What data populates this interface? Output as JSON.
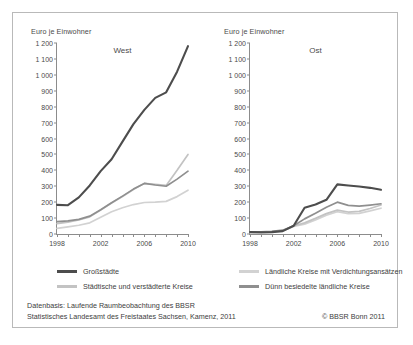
{
  "figure": {
    "axis_title": "Euro je Einwohner",
    "panels": [
      {
        "label": "West",
        "key": "west"
      },
      {
        "label": "Ost",
        "key": "ost"
      }
    ]
  },
  "legend": [
    {
      "label": "Großstädte",
      "color": "#4d4d4d"
    },
    {
      "label": "Ländliche Kreise mit Verdichtungsansätzen",
      "color": "#d2d2d2"
    },
    {
      "label": "Städtische und verstädterte Kreise",
      "color": "#c3c3c3"
    },
    {
      "label": "Dünn besiedelte ländliche Kreise",
      "color": "#8f8f8f"
    }
  ],
  "source": {
    "line1": "Datenbasis: Laufende Raumbeobachtung des BBSR",
    "line2": "Statistisches Landesamt des Freistaates Sachsen, Kamenz, 2011",
    "copyright": "© BBSR Bonn 2011"
  },
  "chart_data": {
    "type": "line",
    "title": "Euro je Einwohner",
    "xlabel": "",
    "ylabel": "Euro je Einwohner",
    "ylim": [
      0,
      1200
    ],
    "ytick_values": [
      0,
      100,
      200,
      300,
      400,
      500,
      600,
      700,
      800,
      900,
      1000,
      1100,
      1200
    ],
    "ytick_labels": [
      "0",
      "100",
      "200",
      "300",
      "400",
      "500",
      "600",
      "700",
      "800",
      "900",
      "1 000",
      "1 100",
      "1 200"
    ],
    "x": [
      1998,
      1999,
      2000,
      2001,
      2002,
      2003,
      2004,
      2005,
      2006,
      2007,
      2008,
      2009,
      2010
    ],
    "xtick_labels": [
      "1998",
      "2002",
      "2006",
      "2010"
    ],
    "xtick_values": [
      1998,
      2002,
      2006,
      2010
    ],
    "grid": false,
    "legend_position": "bottom",
    "panels": [
      {
        "name": "West",
        "series": [
          {
            "name": "Großstädte",
            "color": "#4d4d4d",
            "values": [
              183,
              181,
              230,
              305,
              395,
              470,
              580,
              690,
              780,
              855,
              890,
              1020,
              1180
            ]
          },
          {
            "name": "Ländliche Kreise mit Verdichtungsansätzen",
            "color": "#d2d2d2",
            "values": [
              35,
              45,
              55,
              70,
              105,
              140,
              165,
              185,
              198,
              200,
              205,
              235,
              275
            ]
          },
          {
            "name": "Städtische und verstädterte Kreise",
            "color": "#c3c3c3",
            "values": [
              65,
              75,
              88,
              108,
              150,
              195,
              235,
              280,
              318,
              312,
              305,
              400,
              500
            ]
          },
          {
            "name": "Dünn besiedelte ländliche Kreise",
            "color": "#8f8f8f",
            "values": [
              78,
              82,
              92,
              112,
              152,
              196,
              238,
              282,
              318,
              308,
              300,
              345,
              395
            ]
          }
        ]
      },
      {
        "name": "Ost",
        "series": [
          {
            "name": "Großstädte",
            "color": "#4d4d4d",
            "values": [
              12,
              10,
              12,
              18,
              52,
              165,
              185,
              215,
              312,
              305,
              298,
              290,
              278
            ]
          },
          {
            "name": "Ländliche Kreise mit Verdichtungsansätzen",
            "color": "#d2d2d2",
            "values": [
              10,
              11,
              14,
              20,
              48,
              62,
              88,
              118,
              140,
              128,
              130,
              145,
              162
            ]
          },
          {
            "name": "Städtische und verstädterte Kreise",
            "color": "#c3c3c3",
            "values": [
              11,
              12,
              15,
              22,
              50,
              70,
              98,
              128,
              150,
              138,
              142,
              160,
              182
            ]
          },
          {
            "name": "Dünn besiedelte ländliche Kreise",
            "color": "#8f8f8f",
            "values": [
              14,
              13,
              16,
              24,
              52,
              95,
              130,
              168,
              200,
              180,
              175,
              182,
              190
            ]
          }
        ]
      }
    ]
  }
}
